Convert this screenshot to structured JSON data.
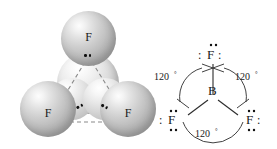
{
  "figure": {
    "molecule_formula": "BF3"
  },
  "model_3d": {
    "name": "space-filling-model",
    "geometry": "trigonal planar",
    "atoms": [
      {
        "id": "f-top",
        "label": "F",
        "role": "fluorine",
        "position": "top"
      },
      {
        "id": "b-center",
        "label": "B",
        "role": "boron",
        "position": "center"
      },
      {
        "id": "f-left",
        "label": "F",
        "role": "fluorine",
        "position": "bottom-left"
      },
      {
        "id": "f-right",
        "label": "F",
        "role": "fluorine",
        "position": "bottom-right"
      }
    ],
    "guide_lines": "dashed-triangle",
    "lone_pair_marks": 3
  },
  "lewis": {
    "name": "lewis-structure",
    "center_atom": "B",
    "terminal_atoms": [
      "F",
      "F",
      "F"
    ],
    "colon": ":",
    "angles": [
      {
        "id": "angle-left",
        "value": "120",
        "degree": "°"
      },
      {
        "id": "angle-right",
        "value": "120",
        "degree": "°"
      },
      {
        "id": "angle-bottom",
        "value": "120",
        "degree": "°"
      }
    ]
  },
  "colors": {
    "sphere_light": "#fdfdfd",
    "sphere_mid": "#c0c0c0",
    "sphere_dark": "#9e9e9e",
    "ink": "#1a1a1a",
    "background": "#ffffff"
  }
}
